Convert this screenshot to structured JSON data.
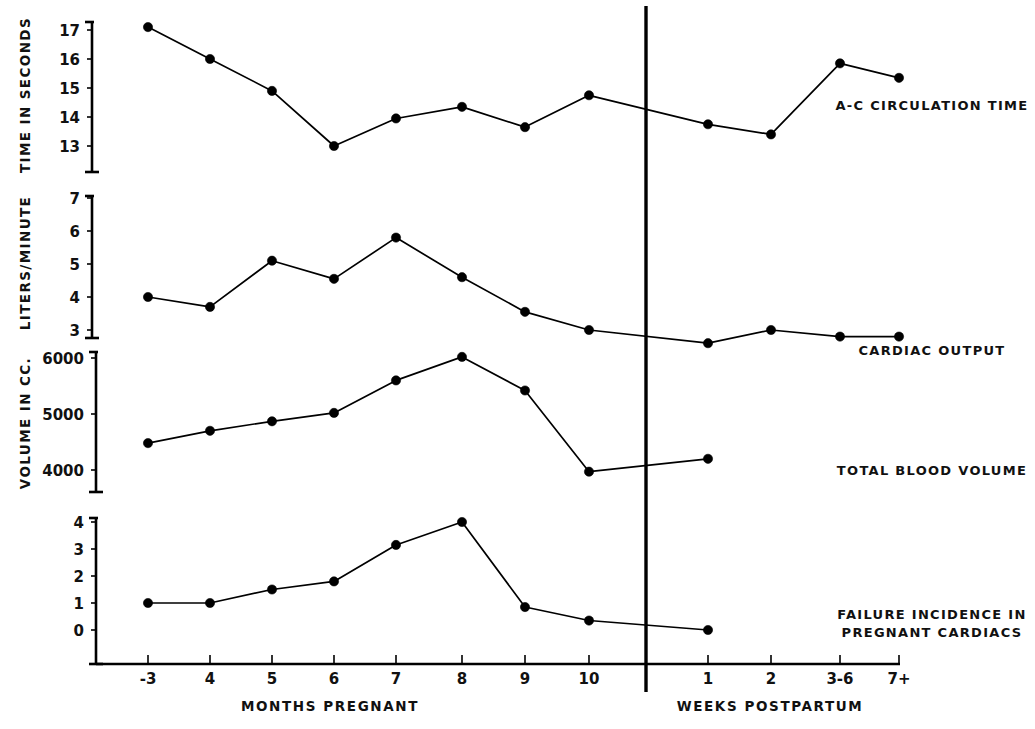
{
  "figure": {
    "background_color": "#ffffff",
    "ink_color": "#000000",
    "width": 1035,
    "height": 729
  },
  "x_axis": {
    "categories": [
      "-3",
      "4",
      "5",
      "6",
      "7",
      "8",
      "9",
      "10",
      "1",
      "2",
      "3-6",
      "7+"
    ],
    "left_section_title": "MONTHS PREGNANT",
    "right_section_title": "WEEKS POSTPARTUM",
    "divider_after_category": "10",
    "tick_labels_visible": [
      "-3",
      "4",
      "5",
      "6",
      "7",
      "8",
      "9",
      "10",
      "1",
      "2",
      "3-6",
      "7+"
    ]
  },
  "panels": [
    {
      "id": "ac-circulation-time",
      "series_label": "A-C CIRCULATION TIME",
      "y_axis_title": "TIME IN SECONDS",
      "y_ticks": [
        17,
        16,
        15,
        14,
        13
      ],
      "y_tick_labels": [
        "17",
        "16",
        "15",
        "14",
        "13"
      ],
      "ylim": [
        12.2,
        17.4
      ]
    },
    {
      "id": "cardiac-output",
      "series_label": "CARDIAC OUTPUT",
      "y_axis_title": "LITERS/MINUTE",
      "y_ticks": [
        7,
        6,
        5,
        4,
        3
      ],
      "y_tick_labels": [
        "7",
        "6",
        "5",
        "4",
        "3"
      ],
      "ylim": [
        2.2,
        7.2
      ]
    },
    {
      "id": "total-blood-volume",
      "series_label": "TOTAL BLOOD VOLUME",
      "y_axis_title": "VOLUME IN CC.",
      "y_ticks": [
        6000,
        5000,
        4000
      ],
      "y_tick_labels": [
        "6000",
        "5000",
        "4000"
      ],
      "ylim": [
        3450,
        6120
      ]
    },
    {
      "id": "failure-incidence",
      "series_label": "FAILURE INCIDENCE IN PREGNANT CARDIACS",
      "series_label_line_1": "FAILURE INCIDENCE IN",
      "series_label_line_2": "PREGNANT CARDIACS",
      "y_axis_title": "",
      "y_ticks": [
        4,
        3,
        2,
        1,
        0
      ],
      "y_tick_labels": [
        "4",
        "3",
        "2",
        "1",
        "0"
      ],
      "ylim": [
        -0.55,
        4.3
      ]
    }
  ],
  "chart_data": [
    {
      "type": "line",
      "title": "A-C CIRCULATION TIME",
      "xlabel": "MONTHS PREGNANT / WEEKS POSTPARTUM",
      "ylabel": "TIME IN SECONDS",
      "ylim": [
        12.2,
        17.4
      ],
      "grid": false,
      "categories": [
        "-3",
        "4",
        "5",
        "6",
        "7",
        "8",
        "9",
        "10",
        "1",
        "2",
        "3-6",
        "7+"
      ],
      "values": [
        17.1,
        16.0,
        14.9,
        13.0,
        13.95,
        14.35,
        13.65,
        14.75,
        13.75,
        13.4,
        15.85,
        15.35
      ]
    },
    {
      "type": "line",
      "title": "CARDIAC OUTPUT",
      "xlabel": "MONTHS PREGNANT / WEEKS POSTPARTUM",
      "ylabel": "LITERS/MINUTE",
      "ylim": [
        2.2,
        7.2
      ],
      "grid": false,
      "categories": [
        "-3",
        "4",
        "5",
        "6",
        "7",
        "8",
        "9",
        "10",
        "1",
        "2",
        "3-6",
        "7+"
      ],
      "values": [
        4.0,
        3.7,
        5.1,
        4.55,
        5.8,
        4.6,
        3.55,
        3.0,
        2.6,
        3.0,
        2.8,
        2.8
      ]
    },
    {
      "type": "line",
      "title": "TOTAL BLOOD VOLUME",
      "xlabel": "MONTHS PREGNANT / WEEKS POSTPARTUM",
      "ylabel": "VOLUME IN CC.",
      "ylim": [
        3450,
        6120
      ],
      "grid": false,
      "categories": [
        "-3",
        "4",
        "5",
        "6",
        "7",
        "8",
        "9",
        "10",
        "1",
        "2"
      ],
      "values": [
        4480,
        4700,
        4870,
        5020,
        5600,
        6020,
        5420,
        3970,
        4200
      ]
    },
    {
      "type": "line",
      "title": "FAILURE INCIDENCE IN PREGNANT CARDIACS",
      "xlabel": "MONTHS PREGNANT / WEEKS POSTPARTUM",
      "ylabel": "",
      "ylim": [
        -0.55,
        4.3
      ],
      "grid": false,
      "categories": [
        "-3",
        "4",
        "5",
        "6",
        "7",
        "8",
        "9",
        "10",
        "1",
        "2"
      ],
      "values": [
        1.0,
        1.0,
        1.5,
        1.8,
        3.15,
        4.0,
        0.85,
        0.35,
        0.0
      ]
    }
  ]
}
